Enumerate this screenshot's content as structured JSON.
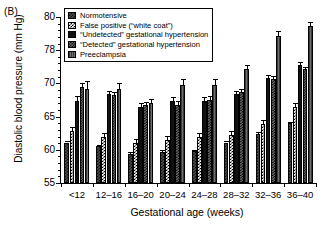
{
  "panel": {
    "label": "(B)"
  },
  "chart_data": {
    "type": "bar",
    "title": "",
    "xlabel": "Gestational age (weeks)",
    "ylabel": "Diastolic blood pressure (mm Hg)",
    "categories": [
      "<12",
      "12–16",
      "16–20",
      "20–24",
      "24–28",
      "28–32",
      "32–36",
      "36–40"
    ],
    "ylim": [
      55,
      80
    ],
    "ytick_labels": [
      "55",
      "60",
      "65",
      "70",
      "78",
      "80"
    ],
    "ytick_values": [
      55,
      60,
      65,
      70,
      75,
      80
    ],
    "grid": false,
    "legend_position": "top-left-inside",
    "series": [
      {
        "name": "Normotensive",
        "pattern": "dark-checker",
        "values": [
          61.1,
          60.5,
          59.4,
          59.7,
          59.8,
          61.1,
          62.4,
          64.0
        ],
        "err_low": [
          0.2,
          0.2,
          0.2,
          0.2,
          0.2,
          0.2,
          0.25,
          0.25
        ],
        "err_high": [
          0.2,
          0.2,
          0.2,
          0.2,
          0.2,
          0.2,
          0.25,
          0.25
        ]
      },
      {
        "name": "False positive (“white coat”)",
        "pattern": "white-checker",
        "values": [
          62.9,
          61.9,
          61.0,
          61.5,
          61.9,
          62.3,
          63.9,
          66.4
        ],
        "err_low": [
          0.6,
          0.6,
          0.6,
          0.6,
          0.6,
          0.6,
          0.6,
          0.6
        ],
        "err_high": [
          0.6,
          0.6,
          0.6,
          0.6,
          0.6,
          0.6,
          0.6,
          0.6
        ]
      },
      {
        "name": "“Undetected” gestational hypertension",
        "pattern": "solid-black",
        "values": [
          67.4,
          68.4,
          66.5,
          67.4,
          67.4,
          68.4,
          70.8,
          72.8
        ],
        "err_low": [
          0.7,
          0.5,
          0.5,
          0.55,
          0.55,
          0.45,
          0.45,
          0.45
        ],
        "err_high": [
          0.7,
          0.5,
          0.5,
          0.55,
          0.55,
          0.45,
          0.45,
          0.45
        ]
      },
      {
        "name": "“Detected” gestational hypertension",
        "pattern": "grey-checker",
        "values": [
          69.5,
          68.2,
          66.7,
          66.8,
          67.5,
          68.7,
          70.6,
          72.1
        ],
        "err_low": [
          0.6,
          0.55,
          0.5,
          0.6,
          0.55,
          0.45,
          0.45,
          0.4
        ],
        "err_high": [
          0.6,
          0.55,
          0.5,
          0.6,
          0.55,
          0.45,
          0.45,
          0.4
        ]
      },
      {
        "name": "Preeclampsia",
        "pattern": "grey-vertical",
        "values": [
          69.2,
          69.1,
          67.0,
          69.7,
          69.8,
          72.1,
          77.2,
          78.6
        ],
        "err_low": [
          1.2,
          0.9,
          0.6,
          0.9,
          0.9,
          0.7,
          0.7,
          0.7
        ],
        "err_high": [
          1.2,
          0.9,
          0.6,
          0.9,
          0.9,
          0.7,
          0.7,
          0.7
        ]
      }
    ]
  }
}
